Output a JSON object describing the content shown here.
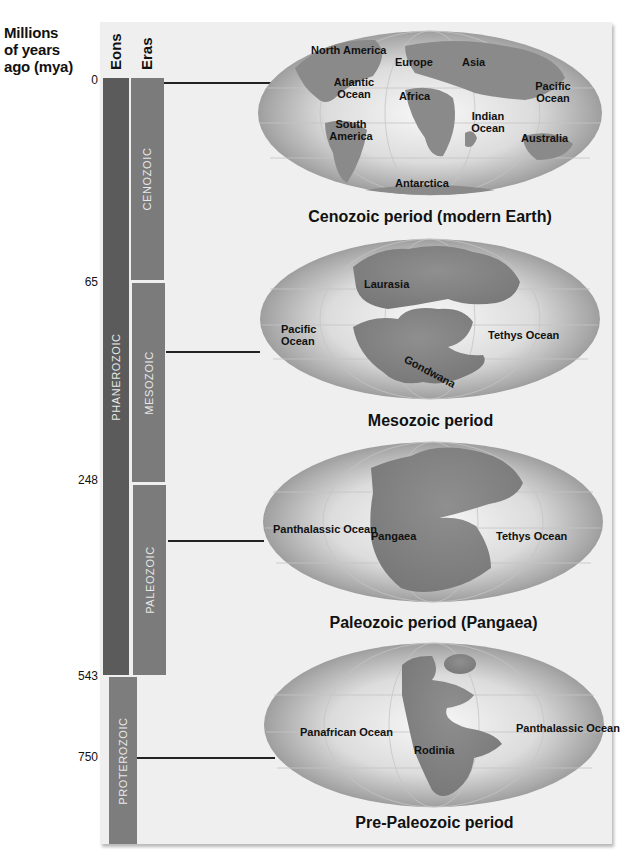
{
  "axis": {
    "title_lines": [
      "Millions",
      "of years",
      "ago (mya)"
    ],
    "columns": {
      "eons": "Eons",
      "eras": "Eras"
    },
    "ticks": [
      {
        "label": "0",
        "y": 80
      },
      {
        "label": "65",
        "y": 282
      },
      {
        "label": "248",
        "y": 480
      },
      {
        "label": "543",
        "y": 676
      },
      {
        "label": "750",
        "y": 757
      }
    ]
  },
  "eons": [
    {
      "name": "PHANEROZOIC",
      "start_mya": 0,
      "end_mya": 543,
      "color": "#5b5b5b"
    },
    {
      "name": "PROTEROZOIC",
      "start_mya": 543,
      "end_mya": null,
      "color": "#7d7d7d"
    }
  ],
  "eras": [
    {
      "name": "CENOZOIC",
      "start_mya": 0,
      "end_mya": 65,
      "color": "#7b7b7b"
    },
    {
      "name": "MESOZOIC",
      "start_mya": 65,
      "end_mya": 248,
      "color": "#7b7b7b"
    },
    {
      "name": "PALEOZOIC",
      "start_mya": 248,
      "end_mya": 543,
      "color": "#7b7b7b"
    }
  ],
  "globes": [
    {
      "caption": "Cenozoic period (modern Earth)",
      "labels": [
        "North America",
        "Europe",
        "Asia",
        "Atlantic Ocean",
        "Africa",
        "Pacific Ocean",
        "Indian Ocean",
        "South America",
        "Australia",
        "Antarctica"
      ]
    },
    {
      "caption": "Mesozoic period",
      "labels": [
        "Laurasia",
        "Pacific Ocean",
        "Tethys Ocean",
        "Gondwana"
      ]
    },
    {
      "caption": "Paleozoic period (Pangaea)",
      "labels": [
        "Panthalassic Ocean",
        "Pangaea",
        "Tethys Ocean"
      ]
    },
    {
      "caption": "Pre-Paleozoic period",
      "labels": [
        "Panafrican Ocean",
        "Panthalassic Ocean",
        "Rodinia"
      ]
    }
  ]
}
